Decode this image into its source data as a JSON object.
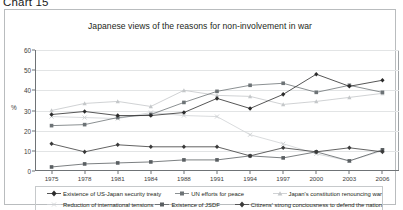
{
  "caption": "Chart 15",
  "chart_data": {
    "type": "line",
    "title": "Japanese views of the reasons for non-involvement in war",
    "xlabel": "",
    "ylabel": "%",
    "ylim": [
      0,
      60
    ],
    "ytick_step": 10,
    "yticks": [
      "0",
      "10",
      "20",
      "30",
      "40",
      "50",
      "60"
    ],
    "grid": true,
    "legend_position": "bottom",
    "categories": [
      "1975",
      "1978",
      "1981",
      "1984",
      "1988",
      "1991",
      "1994",
      "1997",
      "2000",
      "2003",
      "2006"
    ],
    "series": [
      {
        "name": "Existence of US-Japan security treaty",
        "marker": "diamond",
        "color": "#2b2b2b",
        "values": [
          28.0,
          29.5,
          27.5,
          27.5,
          29.0,
          36.0,
          31.0,
          38.0,
          48.0,
          42.0,
          45.0
        ]
      },
      {
        "name": "UN efforts for peace",
        "marker": "square",
        "color": "#6d7376",
        "values": [
          22.5,
          23.0,
          26.5,
          28.0,
          34.0,
          39.5,
          42.5,
          43.5,
          39.0,
          42.5,
          39.0
        ]
      },
      {
        "name": "Japan's constitution renouncing war",
        "marker": "triangle",
        "color": "#c4c7c9",
        "values": [
          30.0,
          33.5,
          34.5,
          32.0,
          40.0,
          37.5,
          37.0,
          33.0,
          34.5,
          36.5,
          38.5
        ]
      },
      {
        "name": "Reduction of international tensions",
        "marker": "cross",
        "color": "#cfd2d4",
        "values": [
          27.0,
          26.5,
          26.0,
          29.0,
          27.5,
          27.0,
          18.0,
          13.5,
          8.5,
          5.0,
          10.0
        ]
      },
      {
        "name": "Existence of JSDF",
        "marker": "square",
        "color": "#5a5f62",
        "values": [
          2.0,
          3.5,
          4.0,
          4.5,
          5.5,
          5.5,
          7.5,
          6.5,
          9.5,
          5.0,
          10.5
        ]
      },
      {
        "name": "Citizens' strong conciousness to defend the nation",
        "marker": "diamond",
        "color": "#3a3a3a",
        "values": [
          13.5,
          9.5,
          13.0,
          12.0,
          12.0,
          12.0,
          7.5,
          11.5,
          9.5,
          11.5,
          9.5
        ]
      }
    ]
  },
  "legend": {
    "items": [
      {
        "label": "Existence of US-Japan security treaty"
      },
      {
        "label": "UN efforts for peace"
      },
      {
        "label": "Japan's constitution renouncing war"
      },
      {
        "label": "Reduction of international tensions"
      },
      {
        "label": "Existence of JSDF"
      },
      {
        "label": "Citizens' strong conciousness to defend the nation"
      }
    ]
  }
}
